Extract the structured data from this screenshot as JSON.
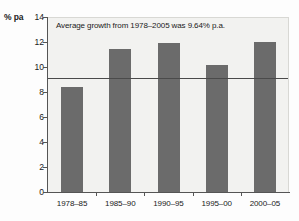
{
  "chart_data": {
    "type": "bar",
    "title": "",
    "subtitle": "",
    "xlabel": "",
    "ylabel": "% pa",
    "ylim": [
      0,
      14
    ],
    "yticks": [
      0,
      2,
      4,
      6,
      8,
      10,
      12,
      14
    ],
    "ytick_labels": [
      "0",
      "2",
      "4",
      "6",
      "8",
      "10",
      "12",
      "14"
    ],
    "grid": false,
    "legend": "none",
    "categories": [
      "1978–85",
      "1985–90",
      "1990–95",
      "1995–00",
      "2000–05"
    ],
    "values": [
      8.4,
      11.45,
      11.95,
      10.2,
      12.0
    ],
    "bar_color": "#6b6b6b",
    "plot_background": "#f2f2f0",
    "axis_color": "#555555",
    "annotations": [
      {
        "text": "Average growth from 1978–2005 was 9.64% p.a.",
        "type": "label"
      },
      {
        "type": "reference-line",
        "orientation": "horizontal",
        "value": 9.2,
        "color": "#4a4a4a"
      }
    ]
  }
}
